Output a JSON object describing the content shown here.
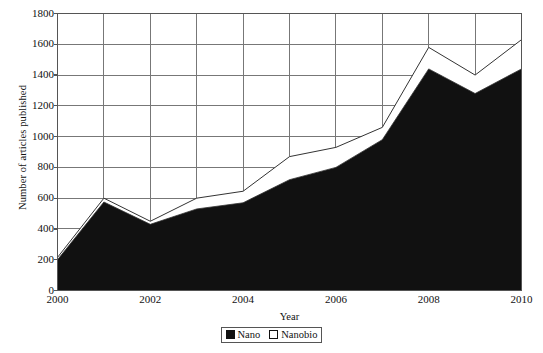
{
  "chart_data": {
    "type": "area",
    "title": "",
    "xlabel": "Year",
    "ylabel": "Number of articles published",
    "x": [
      2000,
      2001,
      2002,
      2003,
      2004,
      2005,
      2006,
      2007,
      2008,
      2009,
      2010
    ],
    "xlim": [
      2000,
      2010
    ],
    "ylim": [
      0,
      1800
    ],
    "ytick_values": [
      0,
      200,
      400,
      600,
      800,
      1000,
      1200,
      1400,
      1600,
      1800
    ],
    "ytick_labels": [
      "0",
      "200",
      "400",
      "600",
      "800",
      "1000",
      "1200",
      "1400",
      "1600",
      "1800"
    ],
    "xtick_values": [
      2000,
      2002,
      2004,
      2006,
      2008,
      2010
    ],
    "xtick_labels": [
      "2000",
      "2002",
      "2004",
      "2006",
      "2008",
      "2010"
    ],
    "xtick_minor_values": [
      2001,
      2003,
      2005,
      2007,
      2009
    ],
    "grid": true,
    "grid_axis": "both",
    "legend_position": "bottom-center",
    "stacked": true,
    "series": [
      {
        "name": "Nano",
        "marker": "filled-square",
        "fill": "#111111",
        "values": [
          200,
          575,
          430,
          530,
          570,
          720,
          800,
          980,
          1440,
          1280,
          1440
        ]
      },
      {
        "name": "Nanobio",
        "marker": "hollow-square",
        "fill": "#ffffff",
        "note": "plotted as cumulative top boundary (Nano + Nanobio)",
        "cumulative_values": [
          215,
          600,
          450,
          600,
          645,
          870,
          930,
          1060,
          1580,
          1400,
          1630
        ],
        "values": [
          15,
          25,
          20,
          70,
          75,
          150,
          130,
          80,
          140,
          120,
          190
        ]
      }
    ]
  },
  "axes": {
    "y_title": "Number of articles published",
    "x_title": "Year"
  },
  "legend": {
    "entries": [
      {
        "label": "Nano",
        "swatch": "filled-square-icon"
      },
      {
        "label": "Nanobio",
        "swatch": "hollow-square-icon"
      }
    ]
  },
  "colors": {
    "nano_fill": "#111111",
    "nanobio_fill": "#ffffff",
    "axis": "#555555",
    "grid": "#777777",
    "text": "#111111",
    "background": "#ffffff"
  }
}
